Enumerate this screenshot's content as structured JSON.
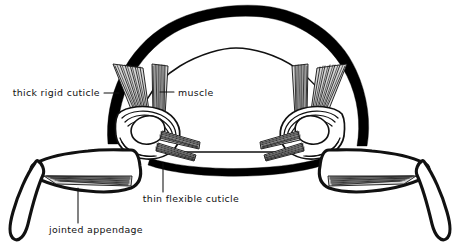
{
  "diagram": {
    "title": "Arthropod body cross-section with jointed appendages",
    "background_color": "#ffffff",
    "ink_color": "#000000",
    "style": "black-and-white line drawing",
    "labels": [
      {
        "id": "thick-rigid-cuticle",
        "text": "thick rigid cuticle",
        "anchor": "end",
        "text_x": 100,
        "text_y": 96,
        "leader": "M104,93 L119,93",
        "points_to": "outer black exoskeleton arc"
      },
      {
        "id": "muscle",
        "text": "muscle",
        "anchor": "start",
        "text_x": 178,
        "text_y": 96,
        "leader": "M160,92 L174,92",
        "points_to": "inner muscle fiber bundle"
      },
      {
        "id": "thin-flexible-cuticle",
        "text": "thin flexible cuticle",
        "anchor": "middle",
        "text_x": 191,
        "text_y": 202,
        "leader": "M163,163 L163,192",
        "points_to": "flexible membrane at leg joint"
      },
      {
        "id": "jointed-appendage",
        "text": "jointed appendage",
        "anchor": "middle",
        "text_x": 96,
        "text_y": 233,
        "leader": "M78,188 L78,223",
        "points_to": "leg segment"
      }
    ],
    "parts": [
      {
        "id": "outer-cuticle",
        "name": "thick rigid cuticle",
        "description": "heavy black arc forming the dorsal shell"
      },
      {
        "id": "ventral-cuticle",
        "name": "thick rigid cuticle (ventral)",
        "description": "heavy black band across the underside"
      },
      {
        "id": "body-cavity",
        "name": "body cavity",
        "description": "thin inner outline below the dorsal shell"
      },
      {
        "id": "left-joint",
        "name": "left leg joint",
        "description": "socket with nested flexible cuticle bands"
      },
      {
        "id": "right-joint",
        "name": "right leg joint",
        "description": "socket with nested flexible cuticle bands"
      },
      {
        "id": "left-appendage",
        "name": "left jointed appendage",
        "description": "two-segment leg with internal muscle"
      },
      {
        "id": "right-appendage",
        "name": "right jointed appendage",
        "description": "two-segment leg with internal muscle"
      },
      {
        "id": "muscle-bundles",
        "name": "muscle",
        "description": "fans of striated fibers attaching shell to limbs"
      }
    ]
  }
}
